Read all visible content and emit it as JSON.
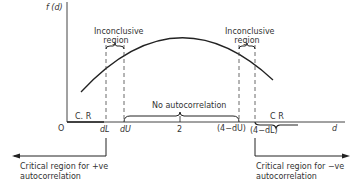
{
  "diagram": {
    "y_axis_label": "f (d)",
    "x_axis_label": "d",
    "origin_label": "O",
    "tick_labels": {
      "dL": "dL",
      "dU": "dU",
      "two": "2",
      "four_minus_dU": "(4−dU)",
      "four_minus_dL": "(4−dL)"
    },
    "regions": {
      "inconclusive_left": "Inconclusive\nregion",
      "inconclusive_right": "Inconclusive\nregion",
      "no_autocorrelation": "No autocorrelation",
      "cr_left": "C. R",
      "cr_right": "C R"
    },
    "arrows": {
      "left": "Critical region for +ve autocorrelation",
      "left_line1": "Critical region for +ve",
      "left_line2": "autocorrelation",
      "right": "Critical region for −ve autocorrelation",
      "right_line1": "Critical region for −ve",
      "right_line2": "autocorrelation"
    },
    "curve": "f(d) density, bell-shaped peaking near d = 2",
    "line_color": "#222222"
  }
}
